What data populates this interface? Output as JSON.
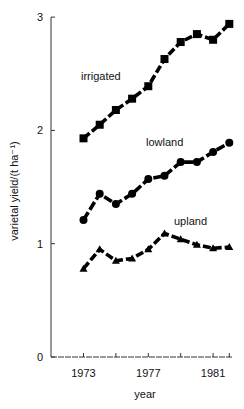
{
  "chart_data": {
    "type": "line",
    "title": "",
    "xlabel": "year",
    "ylabel": "varietal yield/(t ha⁻¹)",
    "x": [
      1973,
      1974,
      1975,
      1976,
      1977,
      1978,
      1979,
      1980,
      1981,
      1982
    ],
    "xticks": [
      1973,
      1974,
      1975,
      1976,
      1977,
      1978,
      1979,
      1980,
      1981,
      1982
    ],
    "xtick_labels": [
      "1973",
      "1977",
      "1981"
    ],
    "yticks": [
      0,
      1,
      2,
      3
    ],
    "ytick_labels": [
      "0",
      "1",
      "2",
      "3"
    ],
    "ylim": [
      0,
      3
    ],
    "xlim": [
      1971.1,
      1982.2
    ],
    "grid": false,
    "legend": "inline labels",
    "series": [
      {
        "name": "irrigated",
        "marker": "square",
        "values": [
          1.93,
          2.05,
          2.18,
          2.28,
          2.39,
          2.63,
          2.78,
          2.85,
          2.8,
          2.94
        ]
      },
      {
        "name": "lowland",
        "marker": "circle",
        "values": [
          1.21,
          1.44,
          1.35,
          1.44,
          1.57,
          1.6,
          1.72,
          1.72,
          1.81,
          1.89
        ]
      },
      {
        "name": "upland",
        "marker": "triangle",
        "values": [
          0.78,
          0.95,
          0.85,
          0.87,
          0.95,
          1.09,
          1.04,
          0.99,
          0.96,
          0.97
        ]
      }
    ],
    "annotations": [
      {
        "text": "irrigated",
        "x_px": 81,
        "y_px": 80
      },
      {
        "text": "lowland",
        "x_px": 146,
        "y_px": 146
      },
      {
        "text": "upland",
        "x_px": 174,
        "y_px": 225
      }
    ]
  }
}
